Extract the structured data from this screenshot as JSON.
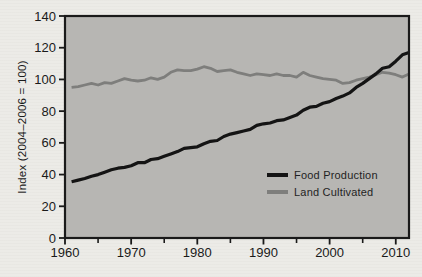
{
  "figure": {
    "kind": "statistical line chart, grey plot panel, framed axes, scanned-print look"
  },
  "colors": {
    "page_bg": "#ecebe7",
    "plot_bg": "#b7b6b3",
    "axis": "#1a1a1a",
    "tick_label": "#1a1a1a",
    "legend_text": "#1f1f1f",
    "food_line": "#141414",
    "land_line": "#7e7e7c"
  },
  "chart_data": {
    "type": "line",
    "title": "",
    "xlabel": "",
    "ylabel": "Index (2004–2006 = 100)",
    "xlim": [
      1960,
      2012
    ],
    "ylim": [
      0,
      140
    ],
    "x_major_ticks": [
      1960,
      1970,
      1980,
      1990,
      2000,
      2010
    ],
    "x_minor_ticks": [
      1965,
      1975,
      1985,
      1995,
      2005
    ],
    "y_ticks": [
      0,
      20,
      40,
      60,
      80,
      100,
      120,
      140
    ],
    "grid": false,
    "legend_position": "inside lower right",
    "x": [
      1961,
      1962,
      1963,
      1964,
      1965,
      1966,
      1967,
      1968,
      1969,
      1970,
      1971,
      1972,
      1973,
      1974,
      1975,
      1976,
      1977,
      1978,
      1979,
      1980,
      1981,
      1982,
      1983,
      1984,
      1985,
      1986,
      1987,
      1988,
      1989,
      1990,
      1991,
      1992,
      1993,
      1994,
      1995,
      1996,
      1997,
      1998,
      1999,
      2000,
      2001,
      2002,
      2003,
      2004,
      2005,
      2006,
      2007,
      2008,
      2009,
      2010,
      2011,
      2012
    ],
    "series": [
      {
        "name": "Food Production",
        "color": "#141414",
        "width": 3.2,
        "values": [
          35.5,
          36.5,
          37.5,
          39,
          40,
          41.5,
          43,
          44,
          44.5,
          45.5,
          47.5,
          47.5,
          49.5,
          50,
          51.5,
          53,
          54.5,
          56.5,
          57,
          57.5,
          59.5,
          61,
          61.5,
          64,
          65.5,
          66.5,
          67.5,
          68.5,
          71,
          72,
          72.5,
          74,
          74.5,
          76,
          77.5,
          80.5,
          82.5,
          83,
          85,
          86,
          88,
          89.5,
          91.5,
          95,
          97.5,
          100.5,
          103.5,
          107,
          108,
          111.5,
          115.5,
          117
        ]
      },
      {
        "name": "Land Cultivated",
        "color": "#7e7e7c",
        "width": 2.8,
        "values": [
          95,
          95.5,
          96.5,
          97.5,
          96.5,
          98,
          97.5,
          99,
          100.5,
          99.5,
          99,
          99.5,
          101,
          100,
          101.5,
          104.5,
          106,
          105.5,
          105.5,
          106.5,
          108,
          107,
          105,
          105.5,
          106,
          104.5,
          103.5,
          102.5,
          103.5,
          103,
          102.5,
          103.5,
          102.5,
          102.5,
          101.5,
          104.5,
          102.5,
          101.5,
          100.5,
          100,
          99.5,
          97.5,
          98,
          99.5,
          100.5,
          101.5,
          103,
          104.5,
          104,
          103,
          101.5,
          103.5
        ]
      }
    ]
  }
}
